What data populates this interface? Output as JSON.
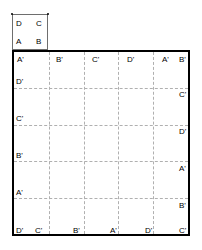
{
  "diagram": {
    "unit_square": {
      "name": "unit-square",
      "corners": {
        "top_left": "D",
        "top_right": "C",
        "bottom_left": "A",
        "bottom_right": "B"
      }
    },
    "grid": {
      "columns": 5,
      "rows": 5,
      "line_style": "dashed",
      "border_color": "#000000",
      "gridline_color": "#b0b0b0",
      "column_fractions": [
        0.2,
        0.4,
        0.6,
        0.8
      ],
      "row_fractions": [
        0.2,
        0.4,
        0.6,
        0.8
      ]
    },
    "labels": {
      "top_row": [
        {
          "text": "A'",
          "x": 17,
          "y": 55
        },
        {
          "text": "B'",
          "x": 56,
          "y": 55
        },
        {
          "text": "C'",
          "x": 92,
          "y": 55
        },
        {
          "text": "D'",
          "x": 127,
          "y": 55
        },
        {
          "text": "A'",
          "x": 162,
          "y": 55
        },
        {
          "text": "B'",
          "x": 179,
          "y": 55
        }
      ],
      "left_column": [
        {
          "text": "D'",
          "x": 16,
          "y": 77
        },
        {
          "text": "C'",
          "x": 16,
          "y": 114
        },
        {
          "text": "B'",
          "x": 16,
          "y": 151
        },
        {
          "text": "A'",
          "x": 16,
          "y": 188
        }
      ],
      "right_column": [
        {
          "text": "C'",
          "x": 179,
          "y": 90
        },
        {
          "text": "D'",
          "x": 179,
          "y": 127
        },
        {
          "text": "A'",
          "x": 179,
          "y": 164
        },
        {
          "text": "B'",
          "x": 179,
          "y": 201
        }
      ],
      "bottom_row": [
        {
          "text": "D'",
          "x": 16,
          "y": 226
        },
        {
          "text": "C'",
          "x": 35,
          "y": 226
        },
        {
          "text": "B'",
          "x": 73,
          "y": 226
        },
        {
          "text": "A'",
          "x": 110,
          "y": 226
        },
        {
          "text": "D'",
          "x": 145,
          "y": 226
        },
        {
          "text": "C'",
          "x": 179,
          "y": 226
        }
      ]
    }
  }
}
